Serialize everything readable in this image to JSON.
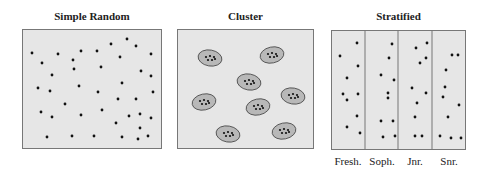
{
  "titles": {
    "simple_random": "Simple Random",
    "cluster": "Cluster",
    "stratified": "Stratified"
  },
  "strata_labels": [
    "Fresh.",
    "Soph.",
    "Jnr.",
    "Snr."
  ],
  "colors": {
    "panel_bg": "#e6e6e6",
    "border": "#777777",
    "dot": "#111111",
    "cluster_fill": "#b8b8b8"
  },
  "simple_random_dots": [
    [
      32,
      53
    ],
    [
      42,
      63
    ],
    [
      58,
      54
    ],
    [
      73,
      60
    ],
    [
      74,
      69
    ],
    [
      81,
      51
    ],
    [
      97,
      51
    ],
    [
      101,
      67
    ],
    [
      111,
      44
    ],
    [
      120,
      57
    ],
    [
      127,
      39
    ],
    [
      136,
      46
    ],
    [
      151,
      54
    ],
    [
      52,
      75
    ],
    [
      38,
      88
    ],
    [
      50,
      91
    ],
    [
      79,
      86
    ],
    [
      98,
      92
    ],
    [
      122,
      83
    ],
    [
      141,
      71
    ],
    [
      151,
      76
    ],
    [
      153,
      92
    ],
    [
      118,
      99
    ],
    [
      136,
      99
    ],
    [
      65,
      104
    ],
    [
      41,
      112
    ],
    [
      52,
      117
    ],
    [
      81,
      115
    ],
    [
      102,
      110
    ],
    [
      116,
      123
    ],
    [
      129,
      116
    ],
    [
      140,
      114
    ],
    [
      151,
      118
    ],
    [
      140,
      128
    ],
    [
      47,
      137
    ],
    [
      72,
      136
    ],
    [
      94,
      136
    ],
    [
      122,
      137
    ],
    [
      138,
      139
    ],
    [
      148,
      136
    ]
  ],
  "clusters": [
    [
      210,
      58
    ],
    [
      272,
      55
    ],
    [
      249,
      82
    ],
    [
      204,
      102
    ],
    [
      293,
      96
    ],
    [
      258,
      107
    ],
    [
      228,
      134
    ],
    [
      284,
      131
    ]
  ],
  "stratified_dots": [
    [
      357,
      43
    ],
    [
      340,
      56
    ],
    [
      358,
      66
    ],
    [
      347,
      78
    ],
    [
      343,
      94
    ],
    [
      358,
      94
    ],
    [
      347,
      100
    ],
    [
      357,
      116
    ],
    [
      347,
      127
    ],
    [
      360,
      133
    ],
    [
      392,
      44
    ],
    [
      389,
      58
    ],
    [
      381,
      75
    ],
    [
      394,
      80
    ],
    [
      388,
      93
    ],
    [
      388,
      98
    ],
    [
      381,
      121
    ],
    [
      393,
      121
    ],
    [
      383,
      137
    ],
    [
      395,
      136
    ],
    [
      416,
      48
    ],
    [
      427,
      43
    ],
    [
      420,
      63
    ],
    [
      426,
      58
    ],
    [
      412,
      88
    ],
    [
      426,
      93
    ],
    [
      417,
      103
    ],
    [
      415,
      117
    ],
    [
      415,
      136
    ],
    [
      422,
      136
    ],
    [
      452,
      55
    ],
    [
      458,
      55
    ],
    [
      446,
      70
    ],
    [
      445,
      87
    ],
    [
      443,
      97
    ],
    [
      459,
      105
    ],
    [
      448,
      117
    ],
    [
      440,
      136
    ],
    [
      451,
      138
    ],
    [
      461,
      138
    ]
  ]
}
